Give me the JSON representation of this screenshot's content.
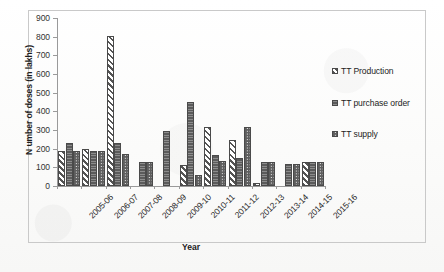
{
  "chart_data": {
    "type": "bar",
    "title": "",
    "xlabel": "Year",
    "ylabel": "N umber of doses (in lakhs)",
    "ylim": [
      0,
      900
    ],
    "ytick_step": 100,
    "yticks": [
      "0",
      "100",
      "200",
      "300",
      "400",
      "500",
      "600",
      "700",
      "800",
      "900"
    ],
    "grid": false,
    "legend_position": "right",
    "categories": [
      "2005-06",
      "2006-07",
      "2007-08",
      "2008-09",
      "2009-10",
      "2010-11",
      "2011-12",
      "2012-13",
      "2013-14",
      "2014-15",
      "2015-16"
    ],
    "series": [
      {
        "name": "TT Production",
        "pattern": "diagonal-hatch",
        "values": [
          190,
          198,
          805,
          0,
          0,
          110,
          315,
          245,
          18,
          0,
          128
        ]
      },
      {
        "name": "TT purchase order",
        "pattern": "solid-dark",
        "values": [
          228,
          190,
          232,
          130,
          297,
          450,
          165,
          150,
          130,
          120,
          130
        ]
      },
      {
        "name": "TT supply",
        "pattern": "checkered",
        "values": [
          190,
          190,
          172,
          130,
          0,
          57,
          132,
          318,
          130,
          120,
          128
        ]
      }
    ]
  },
  "legend": {
    "items": [
      {
        "label": "TT Production"
      },
      {
        "label": "TT purchase order"
      },
      {
        "label": "TT supply"
      }
    ]
  },
  "colors": {
    "axis": "#9a9a9a",
    "bar_outline": "#4a4a4a",
    "series_fill_dark": "#5b5b5b",
    "frame_border": "#c9c9c9",
    "page_background": "#fdfdfc"
  }
}
